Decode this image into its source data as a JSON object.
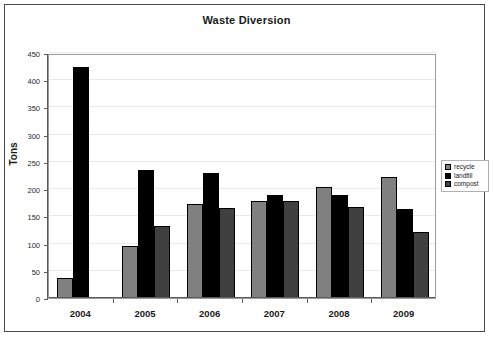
{
  "chart_data": {
    "type": "bar",
    "title": "Waste Diversion",
    "xlabel": "",
    "ylabel": "Tons",
    "categories": [
      "2004",
      "2005",
      "2006",
      "2007",
      "2008",
      "2009"
    ],
    "series": [
      {
        "name": "recycle",
        "color": "#808080",
        "values": [
          36,
          95,
          173,
          179,
          203,
          223
        ]
      },
      {
        "name": "landfill",
        "color": "#000000",
        "values": [
          425,
          235,
          230,
          189,
          190,
          163
        ]
      },
      {
        "name": "compost",
        "color": "#404040",
        "values": [
          0,
          132,
          166,
          178,
          167,
          122
        ]
      }
    ],
    "ylim": [
      0,
      450
    ],
    "yticks": [
      0,
      50,
      100,
      150,
      200,
      250,
      300,
      350,
      400,
      450
    ],
    "ytick_labels": [
      "0",
      "50",
      "100",
      "150",
      "200",
      "250",
      "300",
      "350",
      "400",
      "450"
    ],
    "grid": true,
    "legend_position": "right"
  },
  "legend": {
    "items": [
      {
        "label": "recycle",
        "color": "#808080"
      },
      {
        "label": "landfill",
        "color": "#000000"
      },
      {
        "label": "compost",
        "color": "#404040"
      }
    ]
  }
}
